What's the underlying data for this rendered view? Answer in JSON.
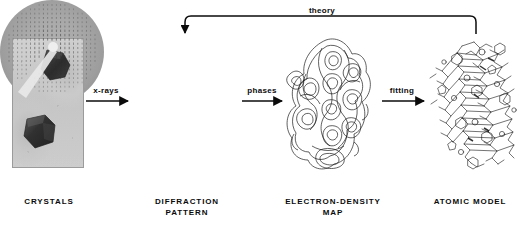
{
  "figure": {
    "background_color": "#ffffff",
    "ink_color": "#0b0b0b"
  },
  "stages": [
    {
      "id": "crystals",
      "caption": "CRYSTALS",
      "image_kind": "photograph",
      "description": "Two dark hexagonal protein crystals on a light gray background"
    },
    {
      "id": "diffraction-pattern",
      "caption": "DIFFRACTION\nPATTERN",
      "image_kind": "x-ray-film-disc",
      "description": "Circular diffraction photograph with a lattice of reflection spots and a white beamstop shadow arm toward lower left"
    },
    {
      "id": "electron-density-map",
      "caption": "ELECTRON-DENSITY\nMAP",
      "image_kind": "contour-drawing",
      "description": "Nested contour loops tracing electron density of the molecule"
    },
    {
      "id": "atomic-model",
      "caption": "ATOMIC MODEL",
      "image_kind": "stick-model-drawing",
      "description": "Line/stick drawing of atomic positions and bonds"
    }
  ],
  "arrows": [
    {
      "id": "arrow-xrays",
      "label": "x-rays",
      "from": "crystals",
      "to": "diffraction-pattern",
      "direction": "right"
    },
    {
      "id": "arrow-phases",
      "label": "phases",
      "from": "diffraction-pattern",
      "to": "electron-density-map",
      "direction": "right"
    },
    {
      "id": "arrow-fitting",
      "label": "fitting",
      "from": "electron-density-map",
      "to": "atomic-model",
      "direction": "right"
    },
    {
      "id": "arrow-theory",
      "label": "theory",
      "from": "atomic-model",
      "to": "diffraction-pattern",
      "direction": "left-bracket"
    }
  ]
}
